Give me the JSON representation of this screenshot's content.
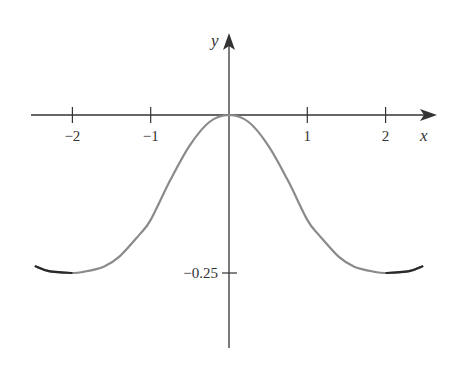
{
  "chart_data": {
    "type": "line",
    "title": "",
    "xlabel": "x",
    "ylabel": "y",
    "x_ticks": [
      -2,
      -1,
      1,
      2
    ],
    "x_tick_labels": [
      "−2",
      "−1",
      "1",
      "2"
    ],
    "y_ticks": [
      -0.25
    ],
    "y_tick_labels": [
      "−0.25"
    ],
    "xlim": [
      -2.5,
      2.5
    ],
    "ylim": [
      -0.29,
      0.09
    ],
    "grid": false,
    "legend": null,
    "series": [
      {
        "name": "f(x)",
        "color": "#808080",
        "x": [
          -2.48,
          -2.3,
          -2.0,
          -1.85,
          -1.6,
          -1.4,
          -1.15,
          -1.0,
          -0.75,
          -0.5,
          -0.25,
          0.0,
          0.25,
          0.5,
          0.75,
          1.0,
          1.15,
          1.4,
          1.6,
          1.85,
          2.0,
          2.3,
          2.48
        ],
        "y": [
          -0.239,
          -0.247,
          -0.25,
          -0.248,
          -0.24,
          -0.224,
          -0.19,
          -0.166,
          -0.103,
          -0.048,
          -0.011,
          0.0,
          -0.011,
          -0.048,
          -0.103,
          -0.166,
          -0.19,
          -0.224,
          -0.24,
          -0.248,
          -0.25,
          -0.247,
          -0.239
        ]
      }
    ],
    "annotations": [
      "Minima at x = ±2, y = −0.25",
      "Maximum at origin (0, 0)"
    ]
  }
}
